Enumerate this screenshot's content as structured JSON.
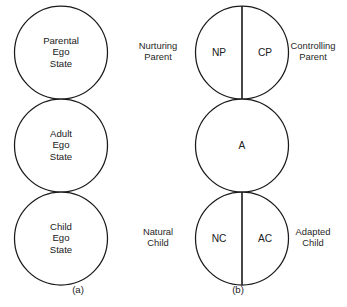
{
  "figure": {
    "type": "diagram",
    "panels": [
      {
        "key": "a",
        "caption": "(a)",
        "circles": [
          {
            "label_lines": [
              "Parental",
              "Ego",
              "State"
            ],
            "divided": false
          },
          {
            "label_lines": [
              "Adult",
              "Ego",
              "State"
            ],
            "divided": false
          },
          {
            "label_lines": [
              "Child",
              "Ego",
              "State"
            ],
            "divided": false
          }
        ]
      },
      {
        "key": "b",
        "caption": "(b)",
        "circles": [
          {
            "divided": true,
            "left_code": "NP",
            "right_code": "CP",
            "left_side_label": [
              "Nurturing",
              "Parent"
            ],
            "right_side_label": [
              "Controlling",
              "Parent"
            ]
          },
          {
            "divided": false,
            "center_code": "A",
            "left_side_label": [],
            "right_side_label": []
          },
          {
            "divided": true,
            "left_code": "NC",
            "right_code": "AC",
            "left_side_label": [
              "Natural",
              "Child"
            ],
            "right_side_label": [
              "Adapted",
              "Child"
            ]
          }
        ]
      }
    ]
  },
  "panel_a": {
    "circle1": {
      "line1": "Parental",
      "line2": "Ego",
      "line3": "State"
    },
    "circle2": {
      "line1": "Adult",
      "line2": "Ego",
      "line3": "State"
    },
    "circle3": {
      "line1": "Child",
      "line2": "Ego",
      "line3": "State"
    },
    "caption": "(a)"
  },
  "panel_b": {
    "circle1": {
      "left_code": "NP",
      "right_code": "CP",
      "left_label_line1": "Nurturing",
      "left_label_line2": "Parent",
      "right_label_line1": "Controlling",
      "right_label_line2": "Parent"
    },
    "circle2": {
      "center_code": "A"
    },
    "circle3": {
      "left_code": "NC",
      "right_code": "AC",
      "left_label_line1": "Natural",
      "left_label_line2": "Child",
      "right_label_line1": "Adapted",
      "right_label_line2": "Child"
    },
    "caption": "(b)"
  },
  "colors": {
    "stroke": "#1a1a1a",
    "text": "#202020",
    "background": "#ffffff"
  }
}
